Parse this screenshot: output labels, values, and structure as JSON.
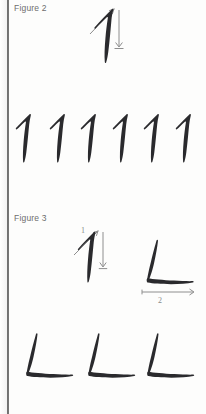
{
  "page": {
    "background_color": "#fdfdfc",
    "ink_color": "#2a2a2d",
    "guide_color": "#8e8e8e",
    "label_color": "#6d6d6d"
  },
  "figures": [
    {
      "id": "figure-2",
      "label": "Figure 2",
      "character": "1",
      "stroke_diagrams": [
        {
          "stroke_number": "1",
          "direction": "down",
          "character": "1"
        }
      ],
      "practice_row": {
        "character": "1",
        "count": 6,
        "items": [
          "1",
          "1",
          "1",
          "1",
          "1",
          "1"
        ]
      }
    },
    {
      "id": "figure-3",
      "label": "Figure 3",
      "character": "L",
      "stroke_diagrams": [
        {
          "stroke_number": "1",
          "direction": "down",
          "character": "1"
        },
        {
          "stroke_number": "2",
          "direction": "right",
          "character": "L"
        }
      ],
      "practice_row": {
        "character": "L",
        "count": 3,
        "items": [
          "L",
          "L",
          "L"
        ]
      }
    }
  ]
}
